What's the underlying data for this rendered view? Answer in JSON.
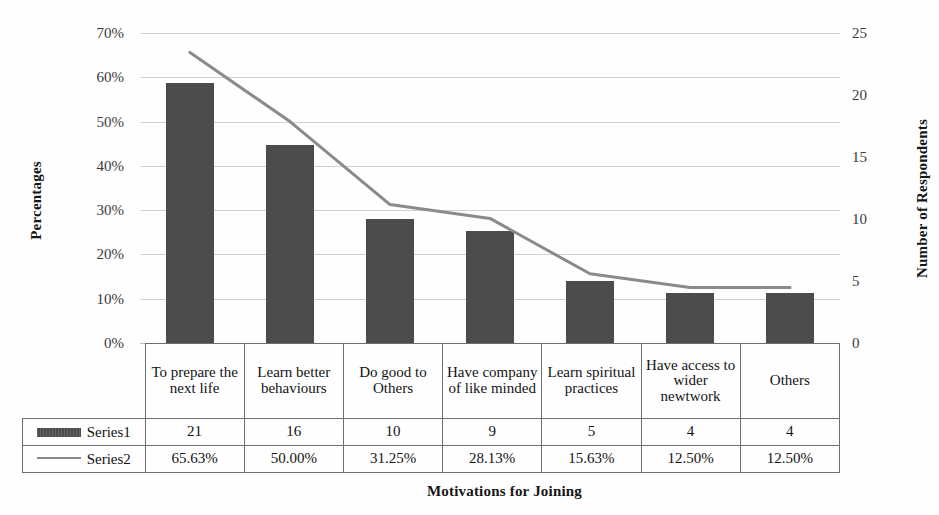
{
  "chart_data": {
    "type": "bar",
    "title": "",
    "xlabel": "Motivations for Joining",
    "ylabel": "Percentages",
    "y2label": "Number of Respondents",
    "grid": true,
    "legend_position": "data-table-left",
    "categories": [
      "To prepare the next life",
      "Learn better behaviours",
      "Do good to Others",
      "Have company of like minded",
      "Learn spiritual practices",
      "Have access to wider newtwork",
      "Others"
    ],
    "ylim": [
      0,
      70
    ],
    "yticks": [
      "0%",
      "10%",
      "20%",
      "30%",
      "40%",
      "50%",
      "60%",
      "70%"
    ],
    "y2lim": [
      0,
      25
    ],
    "y2ticks": [
      "0",
      "5",
      "10",
      "15",
      "20",
      "25"
    ],
    "series": [
      {
        "name": "Series1",
        "type": "bar",
        "axis": "right",
        "values": [
          21,
          16,
          10,
          9,
          5,
          4,
          4
        ],
        "labels": [
          "21",
          "16",
          "10",
          "9",
          "5",
          "4",
          "4"
        ],
        "color": "#4c4c4c"
      },
      {
        "name": "Series2",
        "type": "line",
        "axis": "left",
        "values": [
          65.63,
          50.0,
          31.25,
          28.13,
          15.63,
          12.5,
          12.5
        ],
        "labels": [
          "65.63%",
          "50.00%",
          "31.25%",
          "28.13%",
          "15.63%",
          "12.50%",
          "12.50%"
        ],
        "color": "#8a8a8a"
      }
    ]
  },
  "axes": {
    "left_title": "Percentages",
    "right_title": "Number of Respondents",
    "bottom_title": "Motivations for Joining"
  },
  "table": {
    "category_row": [
      "To prepare the next life",
      "Learn better behaviours",
      "Do good to Others",
      "Have company of like minded",
      "Learn spiritual practices",
      "Have access to wider newtwork",
      "Others"
    ],
    "rows": [
      {
        "legend": "Series1",
        "marker": "bar-swatch",
        "values": [
          "21",
          "16",
          "10",
          "9",
          "5",
          "4",
          "4"
        ]
      },
      {
        "legend": "Series2",
        "marker": "line-swatch",
        "values": [
          "65.63%",
          "50.00%",
          "31.25%",
          "28.13%",
          "15.63%",
          "12.50%",
          "12.50%"
        ]
      }
    ]
  }
}
